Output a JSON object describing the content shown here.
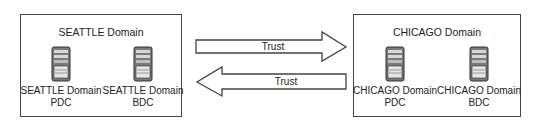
{
  "domains": [
    {
      "name": "SEATTLE Domain",
      "servers": [
        {
          "line1": "SEATTLE  Domain",
          "line2": "PDC",
          "icon": "server-tower-icon"
        },
        {
          "line1": "SEATTLE  Domain",
          "line2": "BDC",
          "icon": "server-tower-icon"
        }
      ]
    },
    {
      "name": "CHICAGO Domain",
      "servers": [
        {
          "line1": "CHICAGO  Domain",
          "line2": "PDC",
          "icon": "server-tower-icon"
        },
        {
          "line1": "CHICAGO  Domain",
          "line2": "BDC",
          "icon": "server-tower-icon"
        }
      ]
    }
  ],
  "trusts": [
    {
      "label": "Trust",
      "direction": "right",
      "from": "SEATTLE Domain",
      "to": "CHICAGO Domain"
    },
    {
      "label": "Trust",
      "direction": "left",
      "from": "CHICAGO Domain",
      "to": "SEATTLE Domain"
    }
  ],
  "colors": {
    "stroke": "#444444",
    "server_body": "#7a7a7a",
    "background": "#ffffff"
  }
}
